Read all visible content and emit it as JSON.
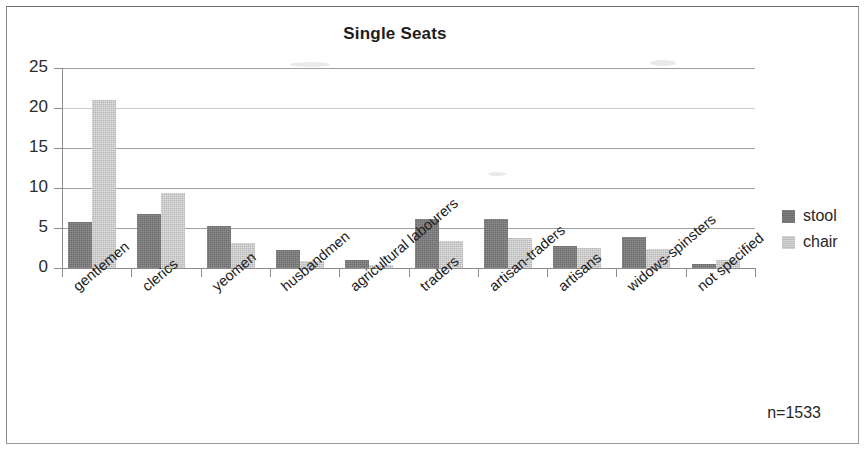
{
  "chart": {
    "title": "Single Seats",
    "annotation": "n=1533",
    "legend_position": "right"
  },
  "legend": {
    "items": [
      {
        "label": "stool",
        "color": "#6d6d6d"
      },
      {
        "label": "chair",
        "color": "#b7b7b7"
      }
    ]
  },
  "axis": {
    "y_ticks": [
      "0",
      "5",
      "10",
      "15",
      "20",
      "25"
    ]
  },
  "chart_data": {
    "type": "bar",
    "title": "Single Seats",
    "xlabel": "",
    "ylabel": "",
    "ylim": [
      0,
      25
    ],
    "ytick_interval": 5,
    "grid": true,
    "legend_position": "right",
    "annotation": "n=1533",
    "categories": [
      "gentlemen",
      "clerics",
      "yeomen",
      "husbandmen",
      "agricultural labourers",
      "traders",
      "artisan-traders",
      "artisans",
      "widows-spinsters",
      "not specified"
    ],
    "series": [
      {
        "name": "stool",
        "color": "#6d6d6d",
        "values": [
          5.8,
          6.8,
          5.3,
          2.3,
          1.0,
          6.1,
          6.1,
          2.8,
          3.9,
          0.5
        ]
      },
      {
        "name": "chair",
        "color": "#b7b7b7",
        "values": [
          21.0,
          9.4,
          3.1,
          0.9,
          0.4,
          3.4,
          3.7,
          2.5,
          2.4,
          1.0
        ]
      }
    ]
  }
}
